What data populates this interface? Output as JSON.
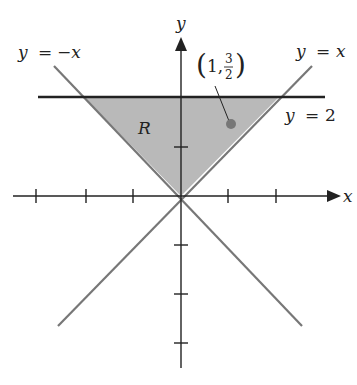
{
  "diagram": {
    "axes": {
      "x_label": "x",
      "y_label": "y"
    },
    "region": {
      "label": "R",
      "fill": "#b8b8b8"
    },
    "lines": {
      "neg": {
        "label_lhs": "y",
        "label_eq": "=",
        "label_rhs": "−x"
      },
      "pos": {
        "label_lhs": "y",
        "label_eq": "=",
        "label_rhs": "x"
      },
      "horizontal": {
        "label_lhs": "y",
        "label_eq": "=",
        "label_rhs": "2"
      }
    },
    "point": {
      "open_paren": "(",
      "x": "1,",
      "y_num": "3",
      "y_den": "2",
      "close_paren": ")"
    },
    "colors": {
      "axis": "#222222",
      "diag_line": "#777777",
      "hline": "#222222",
      "point": "#777777"
    }
  }
}
